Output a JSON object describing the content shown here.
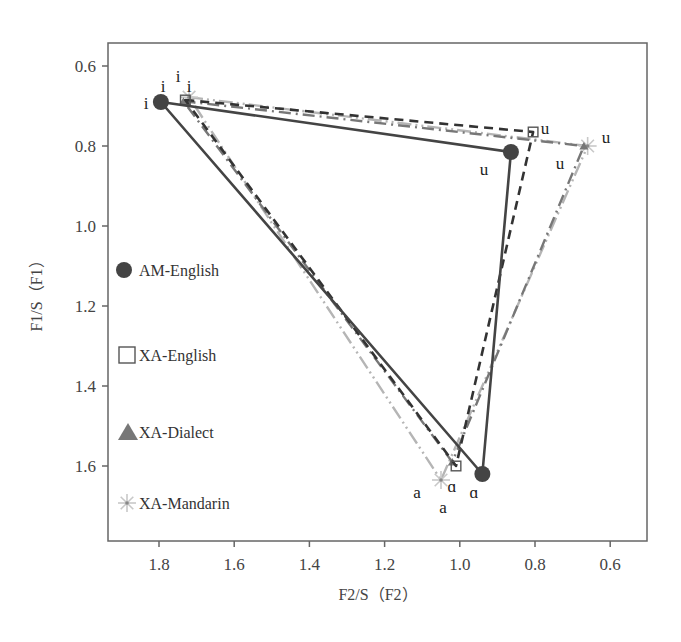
{
  "chart_data": {
    "type": "line",
    "title": "",
    "xlabel": "F2/S（F2）",
    "ylabel": "F1/S（F1）",
    "xlim": [
      1.92,
      0.52
    ],
    "ylim": [
      1.77,
      0.55
    ],
    "x_reversed": true,
    "y_reversed": true,
    "x_ticks": [
      1.8,
      1.6,
      1.4,
      1.2,
      1.0,
      0.8,
      0.6
    ],
    "x_tick_labels": [
      "1.8",
      "1.6",
      "1.4",
      "1.2",
      "1.0",
      "0.8",
      "0.6"
    ],
    "y_ticks": [
      0.6,
      0.8,
      1.0,
      1.2,
      1.4,
      1.6
    ],
    "y_tick_labels": [
      "0.6",
      "0.8",
      "1.0",
      "1.2",
      "1.4",
      "1.6"
    ],
    "grid": false,
    "legend_position": "inside-left",
    "series": [
      {
        "name": "AM-English",
        "marker": "circle",
        "line_style": "solid",
        "color": "#444444",
        "points": [
          {
            "vowel": "i",
            "F2": 1.795,
            "F1": 0.69
          },
          {
            "vowel": "u",
            "F2": 0.864,
            "F1": 0.815
          },
          {
            "vowel": "ɑ",
            "F2": 0.94,
            "F1": 1.62
          }
        ]
      },
      {
        "name": "XA-English",
        "marker": "square",
        "line_style": "dashed",
        "color": "#333333",
        "points": [
          {
            "vowel": "i",
            "F2": 1.73,
            "F1": 0.685
          },
          {
            "vowel": "u",
            "F2": 0.805,
            "F1": 0.765
          },
          {
            "vowel": "ɑ",
            "F2": 1.01,
            "F1": 1.6
          }
        ]
      },
      {
        "name": "XA-Dialect",
        "marker": "triangle",
        "line_style": "dash-dot",
        "color": "#777777",
        "points": [
          {
            "vowel": "i",
            "F2": 1.735,
            "F1": 0.688
          },
          {
            "vowel": "u",
            "F2": 0.67,
            "F1": 0.8
          },
          {
            "vowel": "a",
            "F2": 1.02,
            "F1": 1.59
          }
        ]
      },
      {
        "name": "XA-Mandarin",
        "marker": "star",
        "line_style": "dash-dot-dot",
        "color": "#b5b5b5",
        "points": [
          {
            "vowel": "i",
            "F2": 1.72,
            "F1": 0.678
          },
          {
            "vowel": "u",
            "F2": 0.66,
            "F1": 0.8
          },
          {
            "vowel": "a",
            "F2": 1.05,
            "F1": 1.635
          }
        ]
      }
    ]
  },
  "point_labels": [
    {
      "text": "i",
      "x": 146,
      "y": 109
    },
    {
      "text": "i",
      "x": 163,
      "y": 92
    },
    {
      "text": "i",
      "x": 178,
      "y": 82
    },
    {
      "text": "i",
      "x": 189,
      "y": 92
    },
    {
      "text": "u",
      "x": 545,
      "y": 134
    },
    {
      "text": "u",
      "x": 606,
      "y": 143
    },
    {
      "text": "u",
      "x": 560,
      "y": 169
    },
    {
      "text": "u",
      "x": 484,
      "y": 175
    },
    {
      "text": "a",
      "x": 417,
      "y": 498
    },
    {
      "text": "ɑ",
      "x": 452,
      "y": 492
    },
    {
      "text": "ɑ",
      "x": 474,
      "y": 498
    },
    {
      "text": "a",
      "x": 443,
      "y": 513
    }
  ]
}
